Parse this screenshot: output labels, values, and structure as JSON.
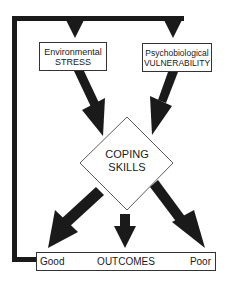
{
  "diagram": {
    "nodes": {
      "stress": {
        "line1": "Environmental",
        "line2": "STRESS"
      },
      "vulnerability": {
        "line1": "Psychobiological",
        "line2": "VULNERABILITY"
      },
      "coping": {
        "line1": "COPING",
        "line2": "SKILLS"
      },
      "outcomes": {
        "left": "Good",
        "center": "OUTCOMES",
        "right": "Poor"
      }
    },
    "edges": [
      {
        "from": "outcomes-good",
        "to": "stress",
        "type": "feedback-loop"
      },
      {
        "from": "outcomes-good",
        "to": "vulnerability",
        "type": "feedback-loop"
      },
      {
        "from": "stress",
        "to": "coping"
      },
      {
        "from": "vulnerability",
        "to": "coping"
      },
      {
        "from": "coping",
        "to": "outcomes-good"
      },
      {
        "from": "coping",
        "to": "outcomes"
      },
      {
        "from": "coping",
        "to": "outcomes-poor"
      }
    ],
    "colors": {
      "line": "#1a1a1a",
      "background": "#ffffff"
    }
  }
}
